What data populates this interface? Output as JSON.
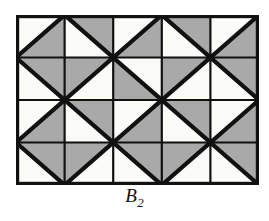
{
  "figure": {
    "name": "triangular-tiling-diagram",
    "caption_base": "B",
    "caption_accent": "~",
    "caption_subscript": "2",
    "caption_full": "B̃₂",
    "colors": {
      "background": "#ffffff",
      "shaded": "#a9a9a9",
      "unshaded": "#fbfbf8",
      "stroke": "#111111",
      "caption": "#111111"
    },
    "geometry": {
      "columns": 5,
      "rows": 4,
      "panel_x": 16,
      "panel_y": 15,
      "panel_width": 243,
      "panel_height": 170,
      "cell_width": 48.6,
      "cell_height": 42.5,
      "border_width": 3.2,
      "grid_line_width": 2.2,
      "diagonal_line_width": 4.2
    },
    "legend": {
      "diag_main": "\\ diagonal from top-left to bottom-right",
      "diag_anti": "/ diagonal from bottom-left to top-right",
      "half_upper": "triangle above the diagonal is shaded",
      "half_lower": "triangle below the diagonal is shaded"
    },
    "cells": [
      [
        {
          "diag": "anti",
          "gray": "lower"
        },
        {
          "diag": "main",
          "gray": "upper"
        },
        {
          "diag": "anti",
          "gray": "lower"
        },
        {
          "diag": "main",
          "gray": "upper"
        },
        {
          "diag": "anti",
          "gray": "lower"
        }
      ],
      [
        {
          "diag": "main",
          "gray": "upper"
        },
        {
          "diag": "anti",
          "gray": "upper"
        },
        {
          "diag": "main",
          "gray": "lower"
        },
        {
          "diag": "anti",
          "gray": "upper"
        },
        {
          "diag": "main",
          "gray": "upper"
        }
      ],
      [
        {
          "diag": "anti",
          "gray": "lower"
        },
        {
          "diag": "main",
          "gray": "upper"
        },
        {
          "diag": "anti",
          "gray": "lower"
        },
        {
          "diag": "main",
          "gray": "upper"
        },
        {
          "diag": "anti",
          "gray": "lower"
        }
      ],
      [
        {
          "diag": "main",
          "gray": "upper"
        },
        {
          "diag": "anti",
          "gray": "upper"
        },
        {
          "diag": "main",
          "gray": "upper"
        },
        {
          "diag": "anti",
          "gray": "upper"
        },
        {
          "diag": "main",
          "gray": "upper"
        }
      ]
    ]
  }
}
